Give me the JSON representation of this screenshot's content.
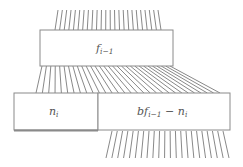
{
  "diagram": {
    "type": "block-wiring",
    "boxes": [
      {
        "id": "top",
        "label_main": "f",
        "label_sub": "i−1",
        "x": 40,
        "y": 30,
        "w": 133,
        "h": 36
      },
      {
        "id": "bottom_left",
        "label_main": "n",
        "label_sub": "i",
        "x": 14,
        "y": 93,
        "w": 84,
        "h": 37
      },
      {
        "id": "bottom_right",
        "label_pre": "bf",
        "label_sub": "i−1",
        "label_mid": " − n",
        "label_sub2": "i",
        "x": 98,
        "y": 93,
        "w": 132,
        "h": 37
      }
    ],
    "wire_groups": [
      {
        "name": "input-wires",
        "count": 24,
        "top": {
          "y": 10,
          "x0": 58,
          "x1": 158
        },
        "bottom": {
          "y": 30,
          "x0": 55,
          "x1": 161
        }
      },
      {
        "name": "fanout-wires",
        "count": 30,
        "top": {
          "y": 66,
          "x0": 42,
          "x1": 170
        },
        "bottom": {
          "y": 93,
          "x0": 36,
          "x1": 220
        }
      },
      {
        "name": "output-wires",
        "count": 22,
        "top": {
          "y": 131,
          "x0": 112,
          "x1": 223
        },
        "bottom": {
          "y": 158,
          "x0": 106,
          "x1": 229
        }
      }
    ],
    "colors": {
      "stroke": "#8a8a8a",
      "wire": "#6a6a6a",
      "text": "#555555",
      "background": "#ffffff"
    }
  }
}
